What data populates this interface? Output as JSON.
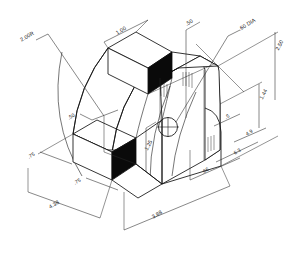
{
  "drawing": {
    "title": "Isometric bracket detail",
    "type": "isometric-engineering-drawing",
    "units": "inches",
    "background_color": "#ffffff",
    "line_color": "#121212",
    "shaded_face_color": "#0a0a0a"
  },
  "dimensions": [
    {
      "id": "radius-outer",
      "label": "2.00R",
      "x": 28,
      "y": 38,
      "rotate": -31,
      "anchor": "middle",
      "kind": "radius"
    },
    {
      "id": "width-top",
      "label": "1.00",
      "x": 122,
      "y": 32,
      "rotate": -31,
      "anchor": "middle",
      "kind": "linear"
    },
    {
      "id": "thickness-top",
      "label": ".50",
      "x": 190,
      "y": 24,
      "rotate": -31,
      "anchor": "middle",
      "kind": "linear"
    },
    {
      "id": "hole-dia",
      "label": ".60 DIA",
      "x": 248,
      "y": 26,
      "rotate": -31,
      "anchor": "middle",
      "kind": "diameter"
    },
    {
      "id": "height-overall",
      "label": "2.50",
      "x": 281,
      "y": 46,
      "rotate": -62,
      "anchor": "middle",
      "kind": "linear"
    },
    {
      "id": "height-plate",
      "label": "1.44",
      "x": 265,
      "y": 95,
      "rotate": -62,
      "anchor": "middle",
      "kind": "linear"
    },
    {
      "id": "radius-inner",
      "label": ".50",
      "x": 72,
      "y": 118,
      "rotate": -31,
      "anchor": "middle",
      "kind": "radius"
    },
    {
      "id": "height-rib",
      "label": "1.25",
      "x": 150,
      "y": 146,
      "rotate": -62,
      "anchor": "middle",
      "kind": "linear"
    },
    {
      "id": "depth-left",
      "label": ".75",
      "x": 32,
      "y": 157,
      "rotate": -31,
      "anchor": "middle",
      "kind": "linear"
    },
    {
      "id": "depth-mid",
      "label": ".75",
      "x": 78,
      "y": 183,
      "rotate": -31,
      "anchor": "middle",
      "kind": "linear"
    },
    {
      "id": "width-base",
      "label": "4.38",
      "x": 55,
      "y": 206,
      "rotate": -31,
      "anchor": "middle",
      "kind": "linear"
    },
    {
      "id": "length-overall",
      "label": "3.88",
      "x": 158,
      "y": 216,
      "rotate": -31,
      "anchor": "middle",
      "kind": "linear"
    },
    {
      "id": "offset-bottom",
      "label": ".66",
      "x": 206,
      "y": 172,
      "rotate": -31,
      "anchor": "middle",
      "kind": "linear"
    },
    {
      "id": "offset-mid",
      "label": "6.3",
      "x": 238,
      "y": 153,
      "rotate": -31,
      "anchor": "middle",
      "kind": "linear"
    },
    {
      "id": "offset-upper",
      "label": "4.9",
      "x": 250,
      "y": 134,
      "rotate": -31,
      "anchor": "middle",
      "kind": "linear"
    },
    {
      "id": "offset-small",
      "label": ".5",
      "x": 228,
      "y": 118,
      "rotate": -31,
      "anchor": "middle",
      "kind": "linear"
    }
  ]
}
